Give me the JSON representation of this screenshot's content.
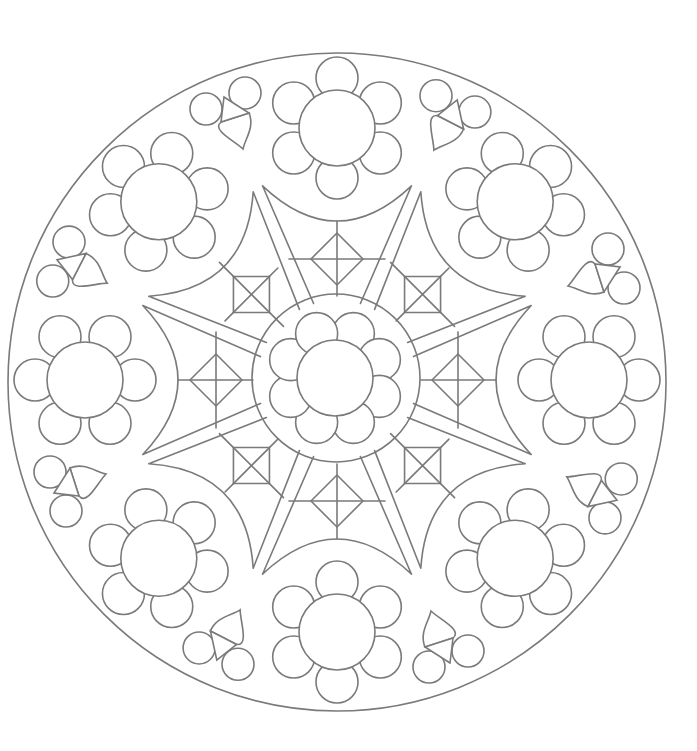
{
  "page": {
    "background": "#ffffff",
    "line_color": "#7a7a7a"
  },
  "mandala": {
    "center": [
      337,
      380
    ],
    "outer_circle_radius": 329,
    "inner_ring_radius": 84,
    "center_flower": {
      "cx": 335,
      "cy": 378,
      "disk_r": 38,
      "petal_r": 21,
      "petal_dist": 48,
      "petals": 8,
      "start_angle": 22.5
    },
    "outer_flowers": {
      "count": 8,
      "ring_r": 252,
      "disk_r": 38,
      "petal_r": 21,
      "petal_dist": 50,
      "petals": 6,
      "start_angle_deg": 0
    },
    "star_pieces": {
      "cardinal": {
        "count": 4,
        "half_span_deg": 21,
        "tip_r": 208,
        "arc_mid_r": 159,
        "inner_r": 84,
        "inner_half_span_deg": 11,
        "motif": "diamond",
        "motif_r": 121,
        "motif_size": 26
      },
      "diagonal": {
        "count": 4,
        "half_span_deg": 21,
        "tip_r": 206,
        "arc_mid_r": 160,
        "inner_r": 84,
        "inner_half_span_deg": 11,
        "motif": "square-x",
        "motif_r": 121,
        "motif_size": 18
      }
    },
    "clusters": {
      "count": 8,
      "base_angle_deg": -22.5,
      "circles": [
        [
          206,
          109,
          16
        ],
        [
          245,
          93,
          16
        ]
      ],
      "triangle": [
        [
          224,
          97
        ],
        [
          249,
          113
        ],
        [
          221,
          122
        ]
      ],
      "drop": {
        "start": [
          221,
          122
        ],
        "end": [
          249,
          113
        ],
        "tip": [
          243,
          149
        ]
      }
    }
  }
}
